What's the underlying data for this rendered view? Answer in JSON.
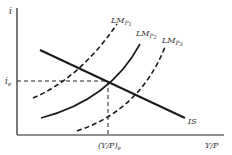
{
  "diagram": {
    "type": "IS-LM diagram",
    "y_axis_label": "i",
    "x_axis_label": "Y/P",
    "equilibrium_interest_label": "i",
    "equilibrium_interest_sub": "e",
    "equilibrium_output_label": "(Y/P)",
    "equilibrium_output_sub": "e",
    "curves": [
      {
        "name": "IS",
        "label": "IS",
        "style": "solid"
      },
      {
        "name": "LM1",
        "label": "LM",
        "sub": "P",
        "subsub": "1",
        "style": "dashed"
      },
      {
        "name": "LM2",
        "label": "LM",
        "sub": "P",
        "subsub": "2",
        "style": "solid"
      },
      {
        "name": "LM3",
        "label": "LM",
        "sub": "P",
        "subsub": "3",
        "style": "dashed"
      }
    ],
    "colors": {
      "line": "#1a1a1a",
      "text": "#333333",
      "background": "#ffffff"
    }
  }
}
